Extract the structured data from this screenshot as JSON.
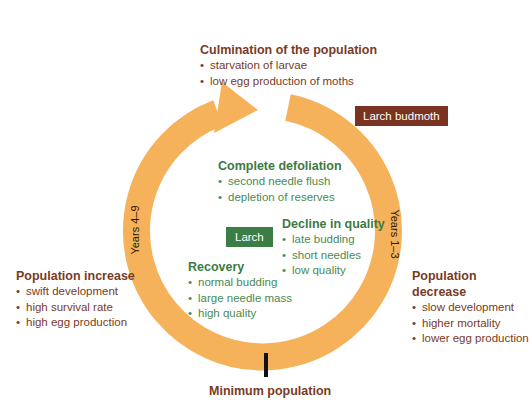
{
  "colors": {
    "ring": "#F5B25A",
    "brown_text": "#7B3A24",
    "green_text": "#3D7A44",
    "budmoth_tag_bg": "#7A3320",
    "larch_tag_bg": "#3B7D45",
    "min_marker": "#111111"
  },
  "culmination": {
    "title": "Culmination of the population",
    "items": [
      "starvation of larvae",
      "low egg production of moths"
    ]
  },
  "tags": {
    "budmoth": "Larch budmoth",
    "larch": "Larch"
  },
  "complete_defoliation": {
    "title": "Complete defoliation",
    "items": [
      "second needle flush",
      "depletion of reserves"
    ]
  },
  "decline_in_quality": {
    "title": "Decline in quality",
    "items": [
      "late budding",
      "short needles",
      "low quality"
    ]
  },
  "recovery": {
    "title": "Recovery",
    "items": [
      "normal budding",
      "large needle mass",
      "high quality"
    ]
  },
  "population_increase": {
    "title": "Population increase",
    "items": [
      "swift development",
      "high survival rate",
      "high egg production"
    ]
  },
  "population_decrease": {
    "title": "Population decrease",
    "items": [
      "slow development",
      "higher mortality",
      "lower egg production"
    ]
  },
  "cycle": {
    "years_left": "Years 4–9",
    "years_right": "Years 1–3",
    "minimum": "Minimum population"
  }
}
